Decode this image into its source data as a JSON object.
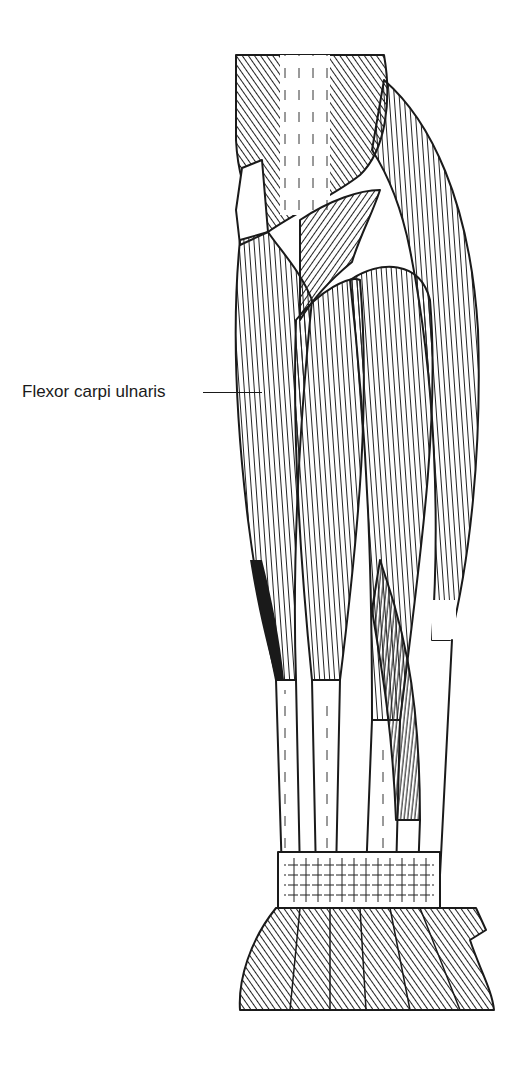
{
  "figure": {
    "stroke_color": "#1a1a1a",
    "background": "#ffffff"
  },
  "labels": [
    {
      "id": "flexor-carpi-ulnaris",
      "text": "Flexor carpi ulnaris",
      "x": 22,
      "y": 383,
      "leader_from_x": 203,
      "leader_to_x": 262,
      "leader_y": 392
    }
  ]
}
